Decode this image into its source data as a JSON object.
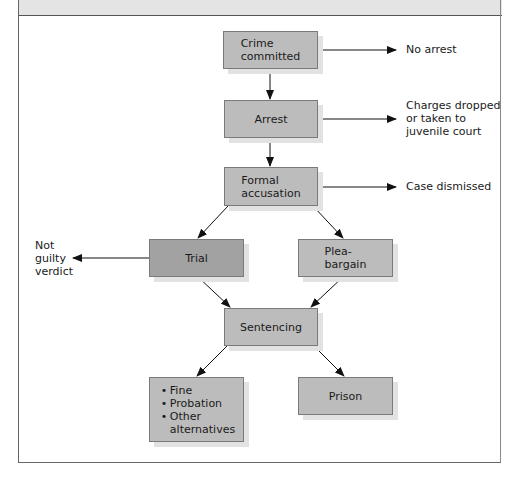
{
  "diagram": {
    "type": "flowchart",
    "nodes": {
      "crime": {
        "line1": "Crime",
        "line2": "committed"
      },
      "arrest": {
        "label": "Arrest"
      },
      "accusation": {
        "line1": "Formal",
        "line2": "accusation"
      },
      "trial": {
        "label": "Trial"
      },
      "plea": {
        "line1": "Plea-",
        "line2": "bargain"
      },
      "sentencing": {
        "label": "Sentencing"
      },
      "alternatives": {
        "items": [
          "Fine",
          "Probation",
          "Other"
        ],
        "last_line": "alternatives"
      },
      "prison": {
        "label": "Prison"
      }
    },
    "outcomes": {
      "no_arrest": "No arrest",
      "charges_dropped": [
        "Charges dropped",
        "or taken to",
        "juvenile court"
      ],
      "case_dismissed": "Case dismissed",
      "not_guilty": [
        "Not",
        "guilty",
        "verdict"
      ]
    },
    "colors": {
      "box_fill": "#bcbcbc",
      "trial_fill": "#a2a2a2",
      "shadow": "#e2e2e2",
      "header_band": "#e4e4e4"
    }
  }
}
